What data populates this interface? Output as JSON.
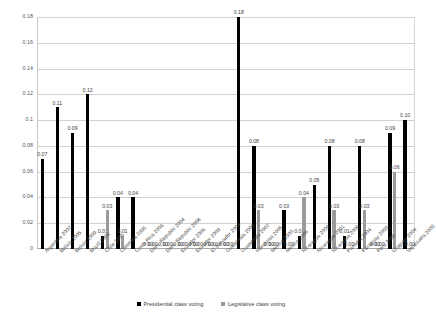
{
  "chart_data": {
    "type": "bar",
    "title": "",
    "subtitle": "",
    "xlabel": "",
    "ylabel": "",
    "ylim": [
      0,
      0.18
    ],
    "grid": true,
    "legend_position": "bottom",
    "ytick_labels": [
      "0",
      "0.02",
      "0.04",
      "0.06",
      "0.08",
      "0.1",
      "0.12",
      "0.14",
      "0.16",
      "0.18"
    ],
    "ytick_values": [
      0,
      0.02,
      0.04,
      0.06,
      0.08,
      0.1,
      0.12,
      0.14,
      0.16,
      0.18
    ],
    "categories": [
      "Argentina 2007",
      "Bolivia 2005",
      "Bolivia 2009",
      "Brazil 2006",
      "Chile 2005",
      "Colombia 2006",
      "Costa Rica 2006",
      "Dom. Republic 2004",
      "Dom. Republic 2008",
      "Ecuador 2006",
      "Ecuador 2009",
      "El Salvador 2004",
      "Guatemala 2003",
      "Guatemala 2007",
      "Honduras 2005",
      "Mexico 2000",
      "Mexico 2006",
      "Nicaragua 2006",
      "Nicaragua 2001",
      "Nicaragua 2006",
      "Panama 2004",
      "Paraguay 2003",
      "Peru 2006",
      "Uruguay 2004",
      "Venezuela 2006"
    ],
    "series": [
      {
        "name": "Presidential class voting",
        "color": "#000000",
        "values": [
          0.07,
          0.11,
          0.09,
          0.12,
          0.01,
          0.04,
          0.04,
          0.0,
          0.0,
          0.0,
          0.0,
          0.0,
          0.0,
          0.18,
          0.08,
          0.0,
          0.03,
          0.01,
          0.05,
          0.08,
          0.01,
          0.08,
          0.0,
          0.09,
          0.1
        ],
        "labels": [
          "0.07",
          "0.11",
          "0.09",
          "0.12",
          "0.01",
          "0.04",
          "0.04",
          "0.00",
          "0.00",
          "0.00",
          "0.00",
          "0.00",
          "0.00",
          "0.18",
          "0.08",
          "0.00",
          "0.03",
          "0.01",
          "0.05",
          "0.08",
          "0.01",
          "0.08",
          "0.00",
          "0.09",
          "0.10"
        ]
      },
      {
        "name": "Legislative class voting",
        "color": "#9b9b9b",
        "values": [
          0.0,
          0.0,
          0.0,
          0.0,
          0.03,
          0.01,
          0.0,
          0.0,
          0.0,
          0.0,
          0.0,
          0.0,
          0.0,
          0.0,
          0.03,
          0.0,
          0.0,
          0.04,
          0.0,
          0.03,
          0.0,
          0.03,
          0.0,
          0.06,
          0.0
        ],
        "labels": [
          "",
          "",
          "",
          "",
          "0.03",
          "0.01",
          "",
          "0.00",
          "0.00",
          "0.00",
          "0.00",
          "0.00",
          "0.00",
          "",
          "0.03",
          "0.00",
          "0.00",
          "0.04",
          "",
          "0.03",
          "0.00",
          "0.03",
          "0.00",
          "0.06",
          "0.00"
        ]
      }
    ]
  },
  "legend": {
    "entries": [
      {
        "label": "Presidential class voting",
        "color": "#000000"
      },
      {
        "label": "Legislative class voting",
        "color": "#9b9b9b"
      }
    ]
  }
}
